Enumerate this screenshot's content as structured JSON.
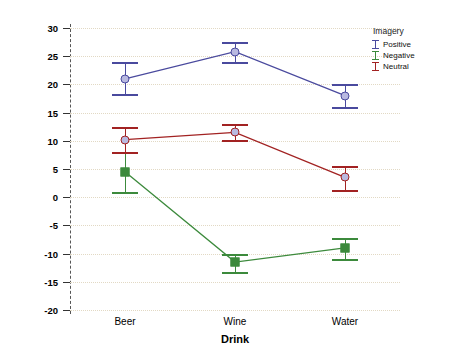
{
  "chart_data": {
    "type": "line",
    "title": "",
    "xlabel": "Drink",
    "ylabel": "Mean Attitude",
    "categories": [
      "Beer",
      "Wine",
      "Water"
    ],
    "ylim": [
      -20,
      30
    ],
    "yticks": [
      30,
      25,
      20,
      15,
      10,
      5,
      0,
      -5,
      -10,
      -15,
      -20
    ],
    "grid": true,
    "legend_title": "Imagery",
    "legend_position": "top-right",
    "series": [
      {
        "name": "Positive",
        "color": "#4a4a9e",
        "marker": "circle",
        "values": [
          21.0,
          25.8,
          18.0
        ],
        "err_low": [
          18.3,
          24.0,
          16.0
        ],
        "err_high": [
          24.0,
          27.6,
          20.0
        ]
      },
      {
        "name": "Negative",
        "color": "#3c8a3c",
        "marker": "square",
        "values": [
          4.5,
          -11.5,
          -9.0
        ],
        "err_low": [
          1.0,
          -13.2,
          -11.0
        ],
        "err_high": [
          8.1,
          -10.0,
          -7.2
        ]
      },
      {
        "name": "Neutral",
        "color": "#a22222",
        "marker": "circle",
        "values": [
          10.2,
          11.5,
          3.5
        ],
        "err_low": [
          8.0,
          10.2,
          1.2
        ],
        "err_high": [
          12.5,
          13.0,
          5.6
        ]
      }
    ],
    "legend_order": [
      "Positive",
      "Negative",
      "Neutral"
    ]
  }
}
